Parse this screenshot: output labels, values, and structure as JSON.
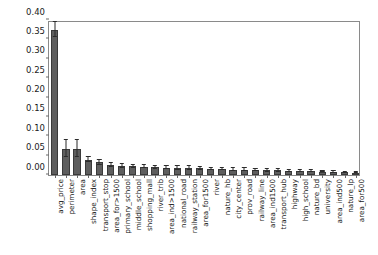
{
  "chart_data": {
    "type": "bar",
    "title": "",
    "xlabel": "",
    "ylabel": "",
    "ylim": [
      0.0,
      0.4
    ],
    "yticks": [
      0.0,
      0.05,
      0.1,
      0.15,
      0.2,
      0.25,
      0.3,
      0.35,
      0.4
    ],
    "ytick_labels": [
      "0.00",
      "0.05",
      "0.10",
      "0.15",
      "0.20",
      "0.25",
      "0.30",
      "0.35",
      "0.40"
    ],
    "grid": false,
    "legend": null,
    "bar_color": "#5e5e5e",
    "error_color": "#2b2b2b",
    "categories": [
      "avg_price",
      "perimeter",
      "area",
      "shape_index",
      "transport_stop",
      "area_for>1500",
      "primary_school",
      "middle_school",
      "shopping_mall",
      "river_trib",
      "area_ind>1500",
      "national_road",
      "railway_station",
      "area_for1500",
      "river",
      "nature_hb",
      "city_center",
      "prov_road",
      "railway_line",
      "area_ind1500",
      "transport_hub",
      "highway",
      "high_school",
      "nature_bd",
      "university",
      "area_ind500",
      "nature_lp",
      "area_for500"
    ],
    "values": [
      0.375,
      0.068,
      0.068,
      0.04,
      0.033,
      0.025,
      0.024,
      0.022,
      0.021,
      0.02,
      0.019,
      0.018,
      0.018,
      0.017,
      0.016,
      0.015,
      0.014,
      0.014,
      0.013,
      0.012,
      0.012,
      0.011,
      0.01,
      0.01,
      0.009,
      0.008,
      0.007,
      0.006
    ],
    "errors": [
      0.02,
      0.022,
      0.022,
      0.007,
      0.006,
      0.005,
      0.005,
      0.005,
      0.004,
      0.004,
      0.004,
      0.004,
      0.004,
      0.003,
      0.003,
      0.003,
      0.003,
      0.003,
      0.003,
      0.003,
      0.003,
      0.002,
      0.002,
      0.002,
      0.002,
      0.002,
      0.002,
      0.002
    ]
  }
}
